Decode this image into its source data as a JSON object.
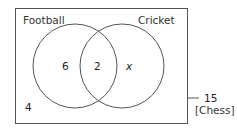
{
  "diagram": {
    "type": "venn",
    "sets": [
      {
        "name": "Football",
        "only_value": "6"
      },
      {
        "name": "Cricket",
        "only_value": "x"
      }
    ],
    "intersection_value": "2",
    "outside_value": "4",
    "annotation": {
      "value": "15",
      "label": "[Chess]"
    },
    "colors": {
      "stroke": "#555555",
      "text": "#333333",
      "background": "#ffffff"
    }
  }
}
